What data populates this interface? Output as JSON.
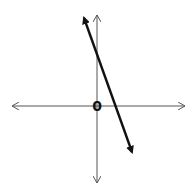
{
  "diagram": {
    "type": "coordinate-plane-line-sketch",
    "axes": {
      "x_axis": {
        "from": [
          12,
          106
        ],
        "to": [
          185,
          106
        ],
        "arrows": "both",
        "color": "#555555"
      },
      "y_axis": {
        "from": [
          97,
          15
        ],
        "to": [
          97,
          183
        ],
        "arrows": "both",
        "color": "#555555"
      }
    },
    "origin_label": "0",
    "line": {
      "from": [
        83,
        15
      ],
      "to": [
        133,
        155
      ],
      "arrows": "both",
      "color": "#111111",
      "slope_sign": "negative",
      "description": "steep decreasing line crossing positive y-axis and positive x-axis"
    }
  }
}
